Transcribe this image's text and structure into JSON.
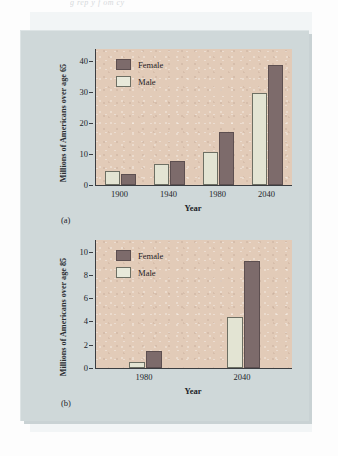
{
  "figure": {
    "caption_remnant": "g         rep y   f  om  cy",
    "legend_labels": {
      "female": "Female",
      "male": "Male"
    },
    "colors": {
      "female_bar": "#7d6b6b",
      "male_bar": "#e3e4d3",
      "plot_background": "#e2cbb8",
      "panel_background": "#cfd8d9",
      "axis": "#3a3d41"
    }
  },
  "chart_data": [
    {
      "type": "bar",
      "id": "chart-a",
      "panel_label": "(a)",
      "title": "",
      "xlabel": "Year",
      "ylabel": "Millions of Americans over age 65",
      "categories": [
        "1900",
        "1940",
        "1980",
        "2040"
      ],
      "yticks": [
        0,
        10,
        20,
        30,
        40
      ],
      "ylim": [
        0,
        44
      ],
      "grid": false,
      "legend_position": "top-left",
      "series": [
        {
          "name": "Male",
          "values": [
            4.5,
            6.7,
            10.8,
            29.8
          ]
        },
        {
          "name": "Female",
          "values": [
            3.7,
            7.7,
            17.2,
            38.7
          ]
        }
      ]
    },
    {
      "type": "bar",
      "id": "chart-b",
      "panel_label": "(b)",
      "title": "",
      "xlabel": "Year",
      "ylabel": "Millions of Americans over age 85",
      "categories": [
        "1980",
        "2040"
      ],
      "yticks": [
        0,
        2,
        4,
        6,
        8,
        10
      ],
      "ylim": [
        0,
        11
      ],
      "grid": false,
      "legend_position": "top-left",
      "series": [
        {
          "name": "Male",
          "values": [
            0.5,
            4.4
          ]
        },
        {
          "name": "Female",
          "values": [
            1.5,
            9.2
          ]
        }
      ]
    }
  ]
}
